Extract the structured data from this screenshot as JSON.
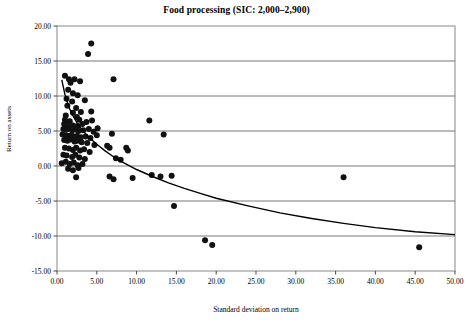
{
  "chart_data": {
    "type": "scatter",
    "title": "Food processing (SIC: 2,000–2,900)",
    "xlabel": "Standard deviation on return",
    "ylabel": "Return on assets",
    "xlim": [
      0,
      50
    ],
    "ylim": [
      -15,
      20
    ],
    "xticks": [
      0,
      5,
      10,
      15,
      20,
      25,
      30,
      35,
      40,
      45,
      50
    ],
    "xtick_labels": [
      "0.00",
      "5.00",
      "10.00",
      "15.00",
      "20.00",
      "25.00",
      "30.00",
      "35.00",
      "40.00",
      "45.00",
      "50.00"
    ],
    "yticks": [
      -15,
      -10,
      -5,
      0,
      5,
      10,
      15,
      20
    ],
    "ytick_labels": [
      "-15.00",
      "-10.00",
      "-5.00",
      "0.00",
      "5.00",
      "10.00",
      "15.00",
      "20.00"
    ],
    "grid": "horizontal",
    "legend": "none",
    "marker_color": "#111111",
    "marker_size": 3.0,
    "trend_color": "#000000",
    "series": [
      {
        "name": "Companies",
        "points": [
          [
            4.3,
            17.5
          ],
          [
            3.9,
            16.0
          ],
          [
            1.0,
            12.9
          ],
          [
            1.5,
            12.4
          ],
          [
            1.7,
            11.9
          ],
          [
            2.2,
            12.4
          ],
          [
            2.9,
            12.1
          ],
          [
            7.1,
            12.4
          ],
          [
            1.4,
            10.9
          ],
          [
            2.0,
            10.4
          ],
          [
            2.6,
            10.1
          ],
          [
            1.2,
            9.6
          ],
          [
            1.9,
            9.2
          ],
          [
            3.5,
            9.4
          ],
          [
            1.3,
            8.6
          ],
          [
            2.4,
            8.3
          ],
          [
            2.0,
            7.6
          ],
          [
            3.0,
            7.7
          ],
          [
            4.3,
            7.8
          ],
          [
            1.1,
            7.2
          ],
          [
            2.5,
            7.0
          ],
          [
            1.0,
            6.6
          ],
          [
            1.6,
            6.4
          ],
          [
            2.8,
            6.6
          ],
          [
            3.7,
            6.3
          ],
          [
            4.4,
            6.5
          ],
          [
            11.6,
            6.5
          ],
          [
            0.9,
            6.0
          ],
          [
            1.3,
            5.9
          ],
          [
            2.0,
            5.8
          ],
          [
            2.6,
            5.7
          ],
          [
            3.2,
            6.0
          ],
          [
            5.1,
            5.4
          ],
          [
            0.8,
            5.3
          ],
          [
            1.2,
            5.2
          ],
          [
            1.5,
            5.4
          ],
          [
            1.9,
            5.1
          ],
          [
            2.3,
            5.2
          ],
          [
            2.7,
            5.0
          ],
          [
            3.3,
            5.1
          ],
          [
            4.0,
            5.3
          ],
          [
            4.6,
            4.9
          ],
          [
            6.9,
            4.6
          ],
          [
            13.4,
            4.5
          ],
          [
            0.7,
            4.5
          ],
          [
            1.1,
            4.4
          ],
          [
            1.4,
            4.3
          ],
          [
            1.8,
            4.4
          ],
          [
            2.1,
            4.2
          ],
          [
            2.5,
            4.3
          ],
          [
            3.0,
            4.1
          ],
          [
            3.6,
            4.2
          ],
          [
            4.2,
            4.0
          ],
          [
            5.0,
            4.4
          ],
          [
            0.9,
            3.7
          ],
          [
            1.3,
            3.6
          ],
          [
            1.7,
            3.8
          ],
          [
            2.2,
            3.5
          ],
          [
            2.6,
            3.6
          ],
          [
            3.1,
            3.4
          ],
          [
            3.8,
            3.3
          ],
          [
            4.7,
            3.0
          ],
          [
            6.3,
            2.9
          ],
          [
            6.6,
            2.6
          ],
          [
            8.7,
            2.6
          ],
          [
            8.9,
            2.2
          ],
          [
            1.0,
            2.6
          ],
          [
            1.5,
            2.5
          ],
          [
            2.0,
            2.3
          ],
          [
            2.4,
            2.6
          ],
          [
            2.9,
            2.2
          ],
          [
            3.4,
            2.4
          ],
          [
            4.1,
            2.0
          ],
          [
            0.8,
            1.6
          ],
          [
            1.2,
            1.5
          ],
          [
            1.9,
            1.3
          ],
          [
            2.3,
            1.6
          ],
          [
            2.8,
            1.2
          ],
          [
            3.5,
            1.0
          ],
          [
            7.4,
            1.1
          ],
          [
            8.0,
            0.9
          ],
          [
            0.6,
            0.4
          ],
          [
            1.1,
            0.6
          ],
          [
            1.6,
            0.3
          ],
          [
            2.1,
            0.5
          ],
          [
            2.6,
            0.1
          ],
          [
            3.2,
            0.3
          ],
          [
            1.4,
            -0.4
          ],
          [
            2.0,
            -0.6
          ],
          [
            2.7,
            -0.3
          ],
          [
            36.0,
            -1.6
          ],
          [
            2.4,
            -1.6
          ],
          [
            6.6,
            -1.5
          ],
          [
            7.1,
            -1.9
          ],
          [
            9.5,
            -1.7
          ],
          [
            11.9,
            -1.3
          ],
          [
            13.0,
            -1.5
          ],
          [
            14.4,
            -1.4
          ],
          [
            14.7,
            -5.7
          ],
          [
            18.6,
            -10.6
          ],
          [
            19.5,
            -11.3
          ],
          [
            45.5,
            -11.6
          ]
        ]
      }
    ],
    "trendline": {
      "name": "Power fit",
      "description": "Decreasing power-law curve from ~12.3 at x≈0.6 to ~-9.7 at x=50",
      "points": [
        [
          0.6,
          12.3
        ],
        [
          1.0,
          10.2
        ],
        [
          1.5,
          8.4
        ],
        [
          2.0,
          7.2
        ],
        [
          2.5,
          6.2
        ],
        [
          3.0,
          5.4
        ],
        [
          3.5,
          4.7
        ],
        [
          4.0,
          4.1
        ],
        [
          5.0,
          3.1
        ],
        [
          6.0,
          2.2
        ],
        [
          7.0,
          1.4
        ],
        [
          8.0,
          0.7
        ],
        [
          9.0,
          0.1
        ],
        [
          10.0,
          -0.5
        ],
        [
          12.0,
          -1.5
        ],
        [
          14.0,
          -2.4
        ],
        [
          16.0,
          -3.2
        ],
        [
          18.0,
          -3.9
        ],
        [
          20.0,
          -4.6
        ],
        [
          24.0,
          -5.7
        ],
        [
          28.0,
          -6.7
        ],
        [
          32.0,
          -7.5
        ],
        [
          36.0,
          -8.2
        ],
        [
          40.0,
          -8.8
        ],
        [
          45.0,
          -9.4
        ],
        [
          50.0,
          -9.8
        ]
      ]
    }
  }
}
